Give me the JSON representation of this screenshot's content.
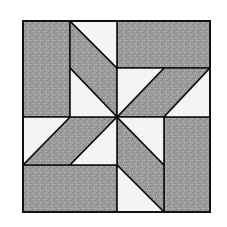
{
  "diagram": {
    "type": "quilt-block",
    "grid_size": 4,
    "colors": {
      "dark": "#9a9a9a",
      "light": "#f4f4f4",
      "outline": "#111111"
    },
    "pieces": [
      {
        "name": "top-left-rectangle",
        "color": "dark",
        "points": [
          [
            0,
            0
          ],
          [
            1,
            0
          ],
          [
            1,
            2
          ],
          [
            0,
            2
          ]
        ]
      },
      {
        "name": "top-right-rectangle",
        "color": "dark",
        "points": [
          [
            2,
            0
          ],
          [
            4,
            0
          ],
          [
            4,
            1
          ],
          [
            2,
            1
          ]
        ]
      },
      {
        "name": "bottom-right-rectangle",
        "color": "dark",
        "points": [
          [
            3,
            2
          ],
          [
            4,
            2
          ],
          [
            4,
            4
          ],
          [
            3,
            4
          ]
        ]
      },
      {
        "name": "bottom-left-rectangle",
        "color": "dark",
        "points": [
          [
            0,
            3
          ],
          [
            2,
            3
          ],
          [
            2,
            4
          ],
          [
            0,
            4
          ]
        ]
      },
      {
        "name": "top-parallelogram",
        "color": "dark",
        "points": [
          [
            1,
            0
          ],
          [
            2,
            1
          ],
          [
            2,
            2
          ],
          [
            1,
            1
          ]
        ]
      },
      {
        "name": "right-parallelogram",
        "color": "dark",
        "points": [
          [
            4,
            1
          ],
          [
            3,
            2
          ],
          [
            2,
            2
          ],
          [
            3,
            1
          ]
        ]
      },
      {
        "name": "bottom-parallelogram",
        "color": "dark",
        "points": [
          [
            2,
            2
          ],
          [
            3,
            3
          ],
          [
            3,
            4
          ],
          [
            2,
            3
          ]
        ]
      },
      {
        "name": "left-parallelogram",
        "color": "dark",
        "points": [
          [
            2,
            2
          ],
          [
            1,
            3
          ],
          [
            0,
            3
          ],
          [
            1,
            2
          ]
        ]
      },
      {
        "name": "top-triangle-outer",
        "color": "light",
        "points": [
          [
            1,
            0
          ],
          [
            2,
            0
          ],
          [
            2,
            1
          ]
        ]
      },
      {
        "name": "top-triangle-inner",
        "color": "light",
        "points": [
          [
            1,
            1
          ],
          [
            2,
            2
          ],
          [
            1,
            2
          ]
        ]
      },
      {
        "name": "right-triangle-inner",
        "color": "light",
        "points": [
          [
            2,
            1
          ],
          [
            3,
            1
          ],
          [
            2,
            2
          ]
        ]
      },
      {
        "name": "right-triangle-outer",
        "color": "light",
        "points": [
          [
            4,
            1
          ],
          [
            4,
            2
          ],
          [
            3,
            2
          ]
        ]
      },
      {
        "name": "bottom-triangle-inner",
        "color": "light",
        "points": [
          [
            2,
            2
          ],
          [
            3,
            2
          ],
          [
            3,
            3
          ]
        ]
      },
      {
        "name": "bottom-triangle-outer",
        "color": "light",
        "points": [
          [
            2,
            3
          ],
          [
            3,
            4
          ],
          [
            2,
            4
          ]
        ]
      },
      {
        "name": "left-triangle-outer",
        "color": "light",
        "points": [
          [
            0,
            2
          ],
          [
            1,
            2
          ],
          [
            0,
            3
          ]
        ]
      },
      {
        "name": "left-triangle-inner",
        "color": "light",
        "points": [
          [
            1,
            3
          ],
          [
            2,
            2
          ],
          [
            2,
            3
          ]
        ]
      }
    ]
  }
}
